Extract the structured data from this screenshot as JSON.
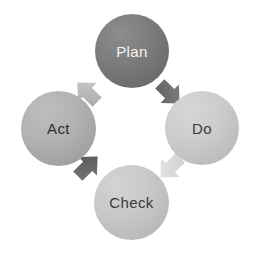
{
  "diagram": {
    "type": "cycle-diagram",
    "background_color": "#ffffff",
    "direction": "clockwise",
    "nodes": [
      {
        "id": "plan",
        "label": "Plan",
        "position": "top",
        "fill_color": "#767676",
        "text_color": "#f4f4f4",
        "shape": "circle"
      },
      {
        "id": "do",
        "label": "Do",
        "position": "right",
        "fill_color": "#c6c6c6",
        "text_color": "#3a3a3a",
        "shape": "circle"
      },
      {
        "id": "check",
        "label": "Check",
        "position": "bottom",
        "fill_color": "#c3c3c3",
        "text_color": "#3a3a3a",
        "shape": "circle"
      },
      {
        "id": "act",
        "label": "Act",
        "position": "left",
        "fill_color": "#acacac",
        "text_color": "#2f2f2f",
        "shape": "circle"
      }
    ],
    "arrows": [
      {
        "id": "plan-to-do",
        "from": "plan",
        "to": "do",
        "direction": "down-right",
        "fill_color": "#6f6f6f"
      },
      {
        "id": "do-to-check",
        "from": "do",
        "to": "check",
        "direction": "down-left",
        "fill_color": "#dcdcdc"
      },
      {
        "id": "check-to-act",
        "from": "check",
        "to": "act",
        "direction": "up-left",
        "fill_color": "#676767"
      },
      {
        "id": "act-to-plan",
        "from": "act",
        "to": "plan",
        "direction": "up-right",
        "fill_color": "#b9b9b9"
      }
    ]
  }
}
